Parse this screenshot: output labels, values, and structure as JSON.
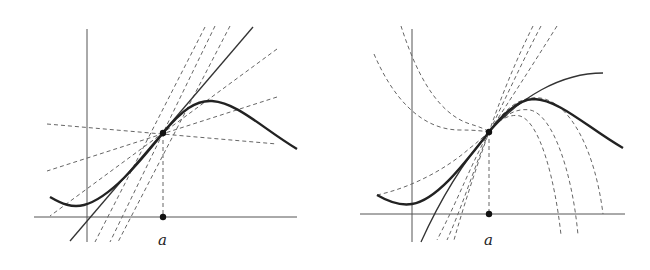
{
  "figure": {
    "left_panel": {
      "title": "Tangent line vs secant-like lines through a point",
      "point_label": "a",
      "description": "Curve f with point (a, f(a)); solid tangent line and several dashed lines through the point"
    },
    "right_panel": {
      "title": "Osculating polynomial vs other curves through a point",
      "point_label": "a",
      "description": "Curve f with point (a, f(a)); solid best-approximating curve and several dashed parabolas through the point"
    }
  },
  "colors": {
    "curve": "#222222",
    "axis": "#555555",
    "dashed": "#666666",
    "background": "#ffffff"
  }
}
